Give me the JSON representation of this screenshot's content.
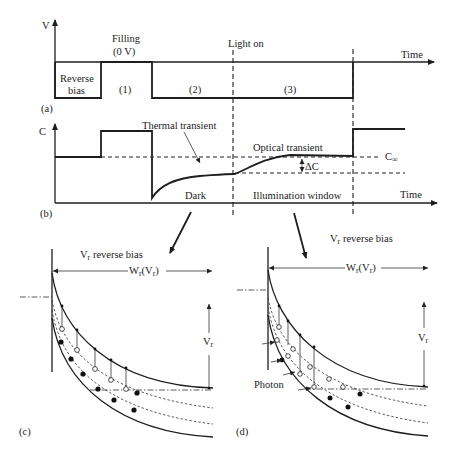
{
  "figure": {
    "panel_a": {
      "tag": "(a)",
      "y_axis_label": "V",
      "x_axis_label": "Time",
      "filling_label_line1": "Filling",
      "filling_label_line2": "(0 V)",
      "light_on_label": "Light on",
      "reverse_bias_line1": "Reverse",
      "reverse_bias_line2": "bias",
      "phase_1": "(1)",
      "phase_2": "(2)",
      "phase_3": "(3)"
    },
    "panel_b": {
      "tag": "(b)",
      "y_axis_label": "C",
      "x_axis_label": "Time",
      "thermal_transient_label": "Thermal transient",
      "optical_transient_label": "Optical transient",
      "c_infinity_label": "C",
      "c_infinity_subscript": "∞",
      "delta_c_label": "ΔC",
      "dark_label": "Dark",
      "illumination_label": "Illumination window"
    },
    "panel_c": {
      "tag": "(c)",
      "title_v": "V",
      "title_sub": "r",
      "title_rest": " reverse bias",
      "width_label_w": "W",
      "width_label_sub": "r",
      "width_label_paren": "(V",
      "width_label_paren_sub": "r",
      "width_label_close": ")",
      "vr_label": "V",
      "vr_sub": "r"
    },
    "panel_d": {
      "tag": "(d)",
      "title_v": "V",
      "title_sub": "r",
      "title_rest": " reverse bias",
      "width_label_w": "W",
      "width_label_sub": "r",
      "width_label_paren": "(V",
      "width_label_paren_sub": "r",
      "width_label_close": ")",
      "vr_label": "V",
      "vr_sub": "r",
      "photon_label": "Photon"
    }
  },
  "colors": {
    "line": "#1e1e1e",
    "background": "#ffffff"
  }
}
